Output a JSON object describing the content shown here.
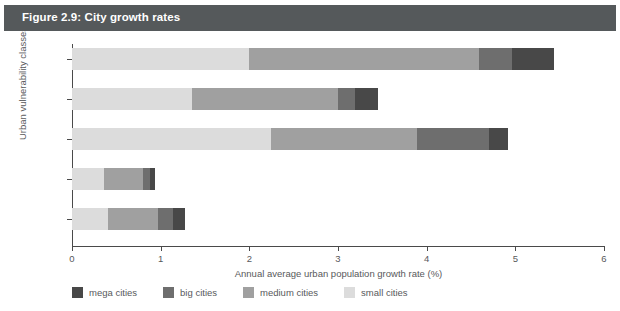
{
  "figure": {
    "title": "Figure 2.9: City growth rates",
    "title_band_color": "#55595b",
    "background_color": "#ffffff",
    "text_color": "#58595b"
  },
  "chart_data": {
    "type": "bar",
    "orientation": "horizontal",
    "stacked": true,
    "title": "Figure 2.9: City growth rates",
    "xlabel": "Annual average urban population growth rate (%)",
    "ylabel": "Urban vulnerability classes",
    "xlim": [
      0,
      6
    ],
    "xticks": [
      0,
      1,
      2,
      3,
      4,
      5,
      6
    ],
    "xtick_labels": [
      "0",
      "1",
      "2",
      "3",
      "4",
      "5",
      "6"
    ],
    "grid": false,
    "legend_position": "bottom",
    "categories": [
      "very high",
      "high",
      "medium",
      "low",
      "very low"
    ],
    "series": [
      {
        "name": "small cities",
        "color": "#dcdcdc",
        "values": [
          2.0,
          1.35,
          2.24,
          0.36,
          0.41
        ]
      },
      {
        "name": "medium cities",
        "color": "#a0a0a0",
        "values": [
          2.59,
          1.65,
          1.65,
          0.44,
          0.56
        ]
      },
      {
        "name": "big cities",
        "color": "#6e6e6e",
        "values": [
          0.37,
          0.19,
          0.81,
          0.08,
          0.17
        ]
      },
      {
        "name": "mega cities",
        "color": "#484848",
        "values": [
          0.48,
          0.26,
          0.22,
          0.06,
          0.13
        ]
      }
    ],
    "totals": [
      5.44,
      3.45,
      4.92,
      0.94,
      1.27
    ],
    "legend": [
      {
        "label": "mega cities",
        "color": "#484848"
      },
      {
        "label": "big cities",
        "color": "#6e6e6e"
      },
      {
        "label": "medium cities",
        "color": "#a0a0a0"
      },
      {
        "label": "small cities",
        "color": "#dcdcdc"
      }
    ]
  }
}
